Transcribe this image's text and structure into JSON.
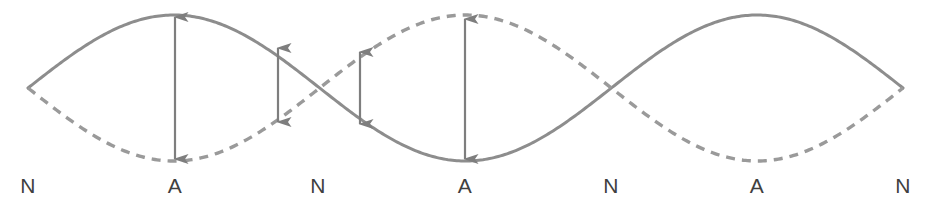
{
  "diagram": {
    "type": "standing-wave",
    "width": 932,
    "height": 205,
    "background_color": "#ffffff",
    "curve_color": "#8d8d8d",
    "arrow_color": "#7e7e7e",
    "label_color": "#3f3f3f",
    "centerline_y": 88,
    "amplitude": 73,
    "stroke_width": 3,
    "dash_pattern": "9 7",
    "curves": [
      {
        "name": "solid-wave",
        "style": "solid",
        "phase_sign": 1,
        "description": "string displacement at one instant"
      },
      {
        "name": "dashed-wave",
        "style": "dashed",
        "phase_sign": -1,
        "description": "string displacement one half-period later"
      }
    ],
    "loops": 3,
    "labels": [
      {
        "text": "N",
        "kind": "node",
        "x": 28,
        "y": 185
      },
      {
        "text": "A",
        "kind": "antinode",
        "x": 175,
        "y": 185
      },
      {
        "text": "N",
        "kind": "node",
        "x": 318,
        "y": 185
      },
      {
        "text": "A",
        "kind": "antinode",
        "x": 465,
        "y": 185
      },
      {
        "text": "N",
        "kind": "node",
        "x": 611,
        "y": 185
      },
      {
        "text": "A",
        "kind": "antinode",
        "x": 757,
        "y": 185
      },
      {
        "text": "N",
        "kind": "node",
        "x": 903,
        "y": 185
      }
    ],
    "arrows": [
      {
        "name": "amplitude-arrow-antinode-1",
        "x": 175,
        "y_top": 17,
        "y_bottom": 159,
        "size": "full"
      },
      {
        "name": "amplitude-arrow-left-of-node-2",
        "x": 278,
        "y_top": 48,
        "y_bottom": 122,
        "size": "partial"
      },
      {
        "name": "amplitude-arrow-right-of-node-2",
        "x": 360,
        "y_top": 52,
        "y_bottom": 124,
        "size": "partial"
      },
      {
        "name": "amplitude-arrow-antinode-2",
        "x": 465,
        "y_top": 19,
        "y_bottom": 159,
        "size": "full"
      }
    ],
    "arrowhead": {
      "width": 11,
      "length": 15
    }
  }
}
